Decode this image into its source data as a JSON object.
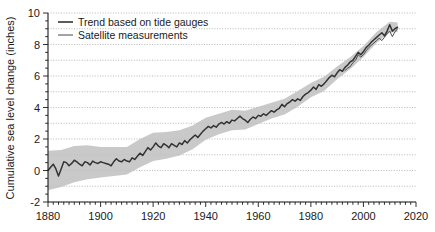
{
  "chart_data": {
    "type": "line",
    "title": "",
    "subtitle": "",
    "xlabel": "",
    "ylabel": "Cumulative sea level change (inches)",
    "xlim": [
      1880,
      2020
    ],
    "ylim": [
      -2,
      10
    ],
    "xticks": [
      1880,
      1900,
      1920,
      1940,
      1960,
      1980,
      2000,
      2020
    ],
    "xtick_labels": [
      "1880",
      "1900",
      "1920",
      "1940",
      "1960",
      "1980",
      "2000",
      "2020"
    ],
    "yticks": [
      -2,
      0,
      2,
      4,
      6,
      8,
      10
    ],
    "ytick_labels": [
      "-2",
      "0",
      "2",
      "4",
      "6",
      "8",
      "10"
    ],
    "x_minor_step": 2,
    "y_minor_step": 0.5,
    "grid": {
      "horizontal": true,
      "vertical": false,
      "step": 1,
      "style": "dotted",
      "color": "#999999"
    },
    "legend": {
      "position": "top-left",
      "entries": [
        {
          "name": "Trend based on tide gauges",
          "color": "#333333",
          "width": 1.6,
          "style": "solid"
        },
        {
          "name": "Satellite measurements",
          "color": "#333333",
          "width": 0.9,
          "style": "solid"
        }
      ]
    },
    "band": {
      "name": "Tide gauge uncertainty range",
      "color": "#bfbfbf",
      "opacity": 0.85
    },
    "series": [
      {
        "name": "Trend based on tide gauges",
        "color": "#333333",
        "x": [
          1880,
          1881,
          1882,
          1883,
          1884,
          1885,
          1886,
          1887,
          1888,
          1889,
          1890,
          1891,
          1892,
          1893,
          1894,
          1895,
          1896,
          1897,
          1898,
          1899,
          1900,
          1901,
          1902,
          1903,
          1904,
          1905,
          1906,
          1907,
          1908,
          1909,
          1910,
          1911,
          1912,
          1913,
          1914,
          1915,
          1916,
          1917,
          1918,
          1919,
          1920,
          1921,
          1922,
          1923,
          1924,
          1925,
          1926,
          1927,
          1928,
          1929,
          1930,
          1931,
          1932,
          1933,
          1934,
          1935,
          1936,
          1937,
          1938,
          1939,
          1940,
          1941,
          1942,
          1943,
          1944,
          1945,
          1946,
          1947,
          1948,
          1949,
          1950,
          1951,
          1952,
          1953,
          1954,
          1955,
          1956,
          1957,
          1958,
          1959,
          1960,
          1961,
          1962,
          1963,
          1964,
          1965,
          1966,
          1967,
          1968,
          1969,
          1970,
          1971,
          1972,
          1973,
          1974,
          1975,
          1976,
          1977,
          1978,
          1979,
          1980,
          1981,
          1982,
          1983,
          1984,
          1985,
          1986,
          1987,
          1988,
          1989,
          1990,
          1991,
          1992,
          1993,
          1994,
          1995,
          1996,
          1997,
          1998,
          1999,
          2000,
          2001,
          2002,
          2003,
          2004,
          2005,
          2006,
          2007,
          2008,
          2009,
          2010,
          2011,
          2012,
          2013
        ],
        "values": [
          0.0,
          0.2,
          0.4,
          0.1,
          -0.35,
          0.1,
          0.55,
          0.5,
          0.3,
          0.45,
          0.65,
          0.55,
          0.4,
          0.3,
          0.55,
          0.5,
          0.35,
          0.6,
          0.5,
          0.45,
          0.55,
          0.5,
          0.45,
          0.4,
          0.3,
          0.55,
          0.75,
          0.6,
          0.55,
          0.7,
          0.6,
          0.55,
          0.8,
          0.7,
          0.9,
          1.1,
          0.95,
          1.2,
          1.45,
          1.3,
          1.5,
          1.75,
          1.55,
          1.45,
          1.7,
          1.6,
          1.45,
          1.7,
          1.6,
          1.5,
          1.75,
          1.65,
          1.9,
          1.75,
          1.95,
          2.1,
          2.25,
          2.1,
          2.3,
          2.5,
          2.65,
          2.8,
          2.7,
          2.85,
          2.75,
          2.95,
          3.05,
          2.95,
          3.1,
          3.0,
          3.2,
          3.15,
          3.3,
          3.45,
          3.3,
          3.2,
          3.05,
          3.25,
          3.4,
          3.3,
          3.5,
          3.45,
          3.6,
          3.5,
          3.65,
          3.8,
          3.7,
          3.85,
          3.95,
          4.2,
          4.05,
          4.25,
          4.35,
          4.5,
          4.4,
          4.55,
          4.45,
          4.7,
          4.85,
          4.95,
          5.1,
          5.3,
          5.15,
          5.45,
          5.35,
          5.5,
          5.7,
          5.9,
          6.05,
          5.95,
          6.2,
          6.4,
          6.3,
          6.55,
          6.7,
          6.9,
          7.0,
          7.25,
          7.5,
          7.35,
          7.55,
          7.8,
          7.95,
          8.15,
          8.3,
          8.45,
          8.6,
          8.75,
          8.55,
          8.85,
          9.25,
          8.85,
          9.0,
          9.1
        ]
      },
      {
        "name": "Satellite measurements",
        "color": "#333333",
        "x": [
          1993,
          1994,
          1995,
          1996,
          1997,
          1998,
          1999,
          2000,
          2001,
          2002,
          2003,
          2004,
          2005,
          2006,
          2007,
          2008,
          2009,
          2010,
          2011,
          2012,
          2013
        ],
        "values": [
          6.35,
          6.5,
          6.6,
          6.85,
          7.0,
          7.35,
          7.2,
          7.35,
          7.6,
          7.8,
          7.95,
          8.1,
          8.25,
          8.4,
          8.25,
          8.45,
          8.7,
          8.85,
          8.5,
          8.8,
          9.0
        ]
      }
    ],
    "band_data": {
      "x": [
        1880,
        1885,
        1890,
        1895,
        1900,
        1905,
        1910,
        1915,
        1920,
        1925,
        1930,
        1935,
        1940,
        1945,
        1950,
        1955,
        1960,
        1965,
        1970,
        1975,
        1980,
        1985,
        1990,
        1995,
        2000,
        2005,
        2010,
        2013
      ],
      "lower": [
        -1.25,
        -1.05,
        -0.75,
        -0.55,
        -0.45,
        -0.35,
        -0.25,
        0.2,
        0.6,
        0.75,
        0.95,
        1.35,
        1.95,
        2.3,
        2.55,
        2.6,
        2.95,
        3.3,
        3.55,
        4.05,
        4.65,
        5.05,
        5.8,
        6.45,
        7.2,
        8.1,
        8.75,
        8.8
      ],
      "upper": [
        1.25,
        1.3,
        1.55,
        1.6,
        1.5,
        1.5,
        1.5,
        2.0,
        2.4,
        2.45,
        2.55,
        2.85,
        3.35,
        3.6,
        3.85,
        3.8,
        4.05,
        4.3,
        4.55,
        5.05,
        5.55,
        5.95,
        6.6,
        7.2,
        7.9,
        8.8,
        9.45,
        9.4
      ]
    }
  },
  "figure": {
    "background": "#ffffff",
    "axis_color": "#1a1a1a"
  }
}
